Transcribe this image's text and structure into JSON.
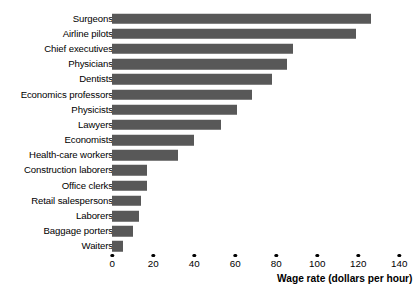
{
  "chart_data": {
    "type": "bar",
    "orientation": "horizontal",
    "title": "",
    "xlabel": "Wage rate (dollars per hour)",
    "ylabel": "",
    "xlim": [
      0,
      140
    ],
    "xticks": [
      0,
      20,
      40,
      60,
      80,
      100,
      120,
      140
    ],
    "xtick_labels": [
      "0",
      "20",
      "40",
      "60",
      "80",
      "100",
      "120",
      "140"
    ],
    "grid": false,
    "legend": null,
    "bar_color": "#585858",
    "categories": [
      "Surgeons",
      "Airline pilots",
      "Chief executives",
      "Physicians",
      "Dentists",
      "Economics professors",
      "Physicists",
      "Lawyers",
      "Economists",
      "Health-care workers",
      "Construction laborers",
      "Office clerks",
      "Retail salespersons",
      "Laborers",
      "Baggage porters",
      "Waiters"
    ],
    "values": [
      126,
      119,
      88,
      85,
      78,
      68,
      61,
      53,
      40,
      32,
      17,
      17,
      14,
      13,
      10,
      5
    ]
  }
}
